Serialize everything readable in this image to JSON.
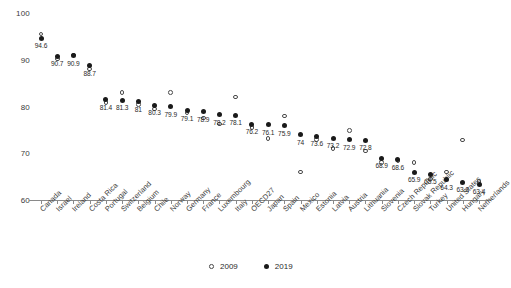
{
  "chart_data": {
    "type": "scatter",
    "title": "",
    "xlabel": "",
    "ylabel": "",
    "ylim": [
      60,
      100
    ],
    "yticks": [
      60,
      70,
      80,
      90,
      100
    ],
    "grid": false,
    "legend_position": "bottom-center",
    "categories": [
      "Canada",
      "Israel",
      "Ireland",
      "Costa Rica",
      "Portugal",
      "Switzerland",
      "Belgium",
      "Chile",
      "Norway",
      "Germany",
      "France",
      "Luxembourg",
      "Italy",
      "OECD27",
      "Japan",
      "Spain",
      "Mexico",
      "Estonia",
      "Latvia",
      "Austria",
      "Lithuania",
      "Slovenia",
      "Czech Republic",
      "Slovak Republic",
      "Turkey",
      "United States",
      "Hungary",
      "Netherlands"
    ],
    "series": [
      {
        "name": "2009",
        "marker": "open-circle",
        "color": "#4a4a4a",
        "labels_shown": false,
        "values": [
          95.5,
          90.2,
          91.0,
          88.0,
          80.9,
          83.0,
          80.4,
          79.5,
          83.0,
          78.6,
          77.5,
          76.3,
          82.0,
          75.5,
          73.2,
          78.0,
          66.0,
          73.0,
          71.0,
          74.9,
          70.5,
          68.0,
          68.5,
          68.0,
          64.5,
          66.0,
          72.8,
          64.0
        ]
      },
      {
        "name": "2019",
        "marker": "filled-circle",
        "color": "#1a1a1a",
        "labels_shown": true,
        "values": [
          94.6,
          90.7,
          90.9,
          88.7,
          81.4,
          81.3,
          81.0,
          80.3,
          79.9,
          79.1,
          78.9,
          78.2,
          78.1,
          76.2,
          76.1,
          75.9,
          74.0,
          73.6,
          73.2,
          72.9,
          72.8,
          68.9,
          68.6,
          65.9,
          65.5,
          64.3,
          63.8,
          63.4
        ]
      }
    ]
  },
  "legend": {
    "items": [
      {
        "label": "2009",
        "marker": "open-circle"
      },
      {
        "label": "2019",
        "marker": "filled-circle"
      }
    ]
  },
  "axis": {
    "y_tick_labels": [
      "100",
      "90",
      "80",
      "70",
      "60"
    ]
  }
}
